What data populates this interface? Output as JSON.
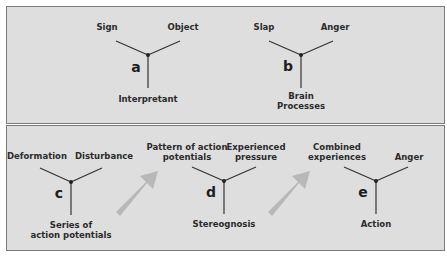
{
  "colors": {
    "panel_bg": "#dedede",
    "panel_border": "#7a7a7a",
    "line": "#333333",
    "arrow": "#b8b8b8"
  },
  "panels": {
    "top": {
      "triads": [
        {
          "id": "a",
          "letter": "a",
          "left": "Sign",
          "right": "Object",
          "bottom": "Interpretant"
        },
        {
          "id": "b",
          "letter": "b",
          "left": "Slap",
          "right": "Anger",
          "bottom_line1": "Brain",
          "bottom_line2": "Processes"
        }
      ]
    },
    "bottom": {
      "triads": [
        {
          "id": "c",
          "letter": "c",
          "left": "Deformation",
          "right": "Disturbance",
          "bottom_line1": "Series of",
          "bottom_line2": "action potentials"
        },
        {
          "id": "d",
          "letter": "d",
          "left_line1": "Pattern of action",
          "left_line2": "potentials",
          "right_line1": "Experienced",
          "right_line2": "pressure",
          "bottom": "Stereognosis"
        },
        {
          "id": "e",
          "letter": "e",
          "left_line1": "Combined",
          "left_line2": "experiences",
          "right": "Anger",
          "bottom": "Action"
        }
      ],
      "arrows": [
        {
          "from": "c",
          "to": "d",
          "direction": "up-right"
        },
        {
          "from": "d",
          "to": "e",
          "direction": "up-right"
        }
      ]
    }
  }
}
